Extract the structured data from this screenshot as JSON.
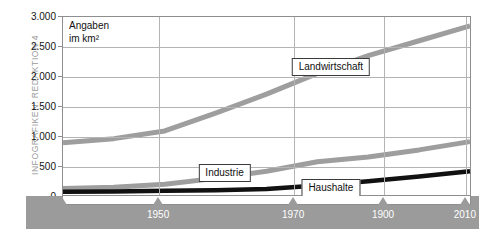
{
  "credit": {
    "text": "INFOGRAFIKEN: REDAKTION 4"
  },
  "note": {
    "line1": "Angaben",
    "line2": "im km²"
  },
  "labels": {
    "landwirtschaft": "Landwirtschaft",
    "industrie": "Industrie",
    "haushalte": "Haushalte"
  },
  "chart_data": {
    "type": "line",
    "title": "",
    "subtitle": "",
    "xlabel": "",
    "ylabel": "Angaben im km²",
    "unit": "km²",
    "grid": true,
    "legend_position": "inline-callouts",
    "xlim": [
      1930,
      2010
    ],
    "ylim": [
      0,
      3000
    ],
    "yticks": [
      0,
      500,
      1000,
      1500,
      2000,
      2500,
      3000
    ],
    "ytick_labels": [
      "0",
      "500",
      "1.000",
      "1.500",
      "2.000",
      "2.500",
      "3.000"
    ],
    "xticks": [
      1950,
      1970,
      1900,
      2010
    ],
    "xtick_labels": [
      "1950",
      "1970",
      "1900",
      "2010"
    ],
    "xtick_positions_frac": [
      0.235,
      0.565,
      0.785,
      0.985
    ],
    "x": [
      1930,
      1940,
      1950,
      1960,
      1970,
      1980,
      1990,
      2000,
      2010
    ],
    "series": [
      {
        "name": "Landwirtschaft",
        "color": "#9e9e9e",
        "values": [
          880,
          950,
          1080,
          1380,
          1700,
          2050,
          2350,
          2600,
          2850
        ]
      },
      {
        "name": "Industrie",
        "color": "#9e9e9e",
        "values": [
          110,
          130,
          180,
          280,
          400,
          560,
          640,
          760,
          900
        ]
      },
      {
        "name": "Haushalte",
        "color": "#111111",
        "values": [
          55,
          60,
          70,
          80,
          100,
          160,
          230,
          310,
          400
        ]
      }
    ],
    "annotations": [
      {
        "text": "Landwirtschaft",
        "x_frac": 0.655,
        "y_value": 2170
      },
      {
        "text": "Industrie",
        "x_frac": 0.395,
        "y_value": 400
      },
      {
        "text": "Haushalte",
        "x_frac": 0.655,
        "y_value": 155
      }
    ]
  }
}
